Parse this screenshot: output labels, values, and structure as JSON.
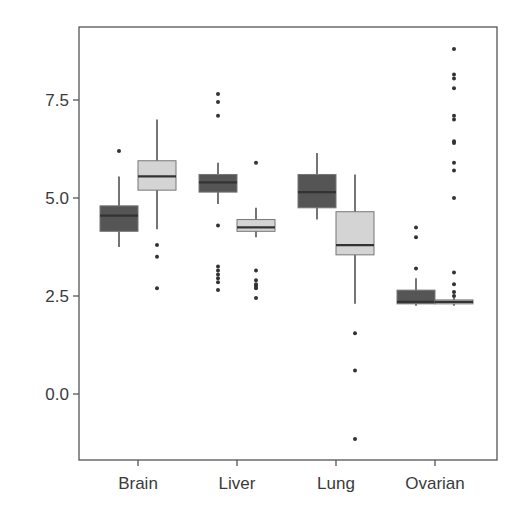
{
  "chart_data": {
    "type": "boxplot",
    "title": "",
    "xlabel": "",
    "ylabel": "",
    "categories": [
      "Brain",
      "Liver",
      "Lung",
      "Ovarian"
    ],
    "yticks": [
      0.0,
      2.5,
      5.0,
      7.5
    ],
    "ytick_labels": [
      "0.0",
      "2.5",
      "5.0",
      "7.5"
    ],
    "ylim": [
      -1.75,
      9.3
    ],
    "grid": false,
    "legend": null,
    "series": [
      {
        "name": "group_dark",
        "color": "#555555",
        "boxes": [
          {
            "category": "Brain",
            "whisker_low": 3.75,
            "q1": 4.15,
            "median": 4.55,
            "q3": 4.8,
            "whisker_high": 5.55,
            "outliers": [
              6.2
            ]
          },
          {
            "category": "Liver",
            "whisker_low": 4.85,
            "q1": 5.15,
            "median": 5.4,
            "q3": 5.6,
            "whisker_high": 5.9,
            "outliers": [
              7.65,
              7.45,
              7.1,
              4.3,
              3.25,
              3.15,
              3.05,
              2.95,
              2.85,
              2.65
            ]
          },
          {
            "category": "Lung",
            "whisker_low": 4.45,
            "q1": 4.75,
            "median": 5.15,
            "q3": 5.6,
            "whisker_high": 6.15,
            "outliers": []
          },
          {
            "category": "Ovarian",
            "whisker_low": 2.25,
            "q1": 2.3,
            "median": 2.35,
            "q3": 2.65,
            "whisker_high": 2.95,
            "outliers": [
              4.25,
              4.0,
              3.2
            ]
          }
        ]
      },
      {
        "name": "group_light",
        "color": "#d4d4d4",
        "boxes": [
          {
            "category": "Brain",
            "whisker_low": 4.2,
            "q1": 5.2,
            "median": 5.55,
            "q3": 5.95,
            "whisker_high": 7.0,
            "outliers": [
              3.8,
              3.5,
              2.7
            ]
          },
          {
            "category": "Liver",
            "whisker_low": 4.0,
            "q1": 4.15,
            "median": 4.25,
            "q3": 4.45,
            "whisker_high": 4.75,
            "outliers": [
              5.9,
              3.15,
              2.9,
              2.8,
              2.75,
              2.7,
              2.45
            ]
          },
          {
            "category": "Lung",
            "whisker_low": 2.3,
            "q1": 3.55,
            "median": 3.8,
            "q3": 4.65,
            "whisker_high": 5.6,
            "outliers": [
              1.55,
              0.6,
              -1.15
            ]
          },
          {
            "category": "Ovarian",
            "whisker_low": 2.25,
            "q1": 2.3,
            "median": 2.35,
            "q3": 2.4,
            "whisker_high": 2.45,
            "outliers": [
              8.8,
              8.15,
              8.05,
              7.8,
              7.1,
              7.0,
              6.45,
              6.4,
              5.9,
              5.7,
              5.0,
              3.1,
              2.8,
              2.6,
              2.5
            ]
          }
        ]
      }
    ]
  },
  "style": {
    "frame_color": "#555555",
    "outlier_color": "#333333",
    "median_color": "#333333",
    "text_color": "#3a3a3a"
  }
}
